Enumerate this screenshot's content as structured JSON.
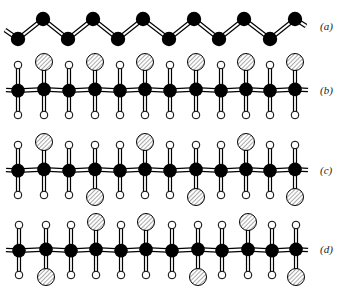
{
  "figure": {
    "colors": {
      "carbon": "#000000",
      "hydrogen_fill": "#ffffff",
      "substituent_hatch": "#555555",
      "bond": "#000000",
      "background": "#ffffff"
    },
    "legend": {
      "carbon": "black filled circle",
      "hydrogen": "small open circle",
      "substituent": "large hatched circle"
    },
    "panels": [
      {
        "id": "a",
        "label": "(a)",
        "label_pos": [
          322,
          30
        ],
        "type": "zigzag",
        "backbone": [
          [
            18,
            39
          ],
          [
            43,
            19
          ],
          [
            68,
            39
          ],
          [
            93,
            19
          ],
          [
            118,
            39
          ],
          [
            143,
            19
          ],
          [
            169,
            39
          ],
          [
            194,
            19
          ],
          [
            219,
            39
          ],
          [
            244,
            19
          ],
          [
            270,
            39
          ],
          [
            295,
            19
          ]
        ],
        "stub_left": [
          [
            5,
            30
          ]
        ],
        "stub_right": [
          [
            306,
            26
          ]
        ]
      },
      {
        "id": "b",
        "label": "(b)",
        "label_pos": [
          322,
          95
        ],
        "type": "side",
        "y": 90,
        "x": [
          18,
          44,
          69,
          95,
          120,
          145,
          170,
          196,
          221,
          246,
          270,
          295
        ],
        "top": [
          "H",
          "X",
          "H",
          "X",
          "H",
          "X",
          "H",
          "X",
          "H",
          "X",
          "H",
          "X"
        ],
        "bottom": [
          "H",
          "H",
          "H",
          "H",
          "H",
          "H",
          "H",
          "H",
          "H",
          "H",
          "H",
          "H"
        ]
      },
      {
        "id": "c",
        "label": "(c)",
        "label_pos": [
          322,
          175
        ],
        "type": "side",
        "y": 170,
        "x": [
          18,
          44,
          69,
          95,
          120,
          145,
          170,
          196,
          221,
          246,
          270,
          295
        ],
        "top": [
          "H",
          "X",
          "H",
          "H",
          "H",
          "X",
          "H",
          "H",
          "H",
          "X",
          "H",
          "H"
        ],
        "bottom": [
          "H",
          "H",
          "H",
          "X",
          "H",
          "H",
          "H",
          "X",
          "H",
          "H",
          "H",
          "X"
        ]
      },
      {
        "id": "d",
        "label": "(d)",
        "label_pos": [
          322,
          254
        ],
        "type": "side",
        "y": 250,
        "x": [
          19,
          46,
          71,
          96,
          121,
          146,
          172,
          198,
          222,
          248,
          272,
          296
        ],
        "top": [
          "H",
          "H",
          "H",
          "X",
          "H",
          "X",
          "H",
          "H",
          "H",
          "X",
          "H",
          "H"
        ],
        "bottom": [
          "H",
          "X",
          "H",
          "H",
          "H",
          "H",
          "H",
          "X",
          "H",
          "H",
          "H",
          "X"
        ]
      }
    ]
  }
}
